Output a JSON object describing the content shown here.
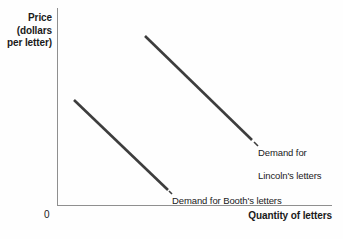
{
  "chart_data": {
    "type": "line",
    "title": "",
    "xlabel": "Quantity of letters",
    "ylabel": "Price\n(dollars\nper letter)",
    "ylabel_lines": [
      "Price",
      "(dollars",
      "per letter)"
    ],
    "origin_label": "0",
    "grid": false,
    "axes_shown": [
      "x",
      "y"
    ],
    "tick_labels": {
      "x": [],
      "y": []
    },
    "legend_position": "inline-annotation",
    "series": [
      {
        "name": "Demand for Lincoln's letters",
        "label_lines": [
          "Demand for",
          "Lincoln's letters"
        ],
        "color": "#3d3d3d",
        "x": [
          0.32,
          0.71
        ],
        "y": [
          0.86,
          0.33
        ],
        "description": "Higher demand curve, positioned up and to the right"
      },
      {
        "name": "Demand for Booth's letters",
        "label_lines": [
          "Demand for Booth's letters"
        ],
        "color": "#3d3d3d",
        "x": [
          0.06,
          0.4
        ],
        "y": [
          0.53,
          0.08
        ],
        "description": "Lower demand curve, positioned down and to the left"
      }
    ],
    "annotations": [
      {
        "text": "Demand for Lincoln's letters",
        "anchor": "right-of-upper-curve"
      },
      {
        "text": "Demand for Booth's letters",
        "anchor": "right-of-lower-curve"
      }
    ],
    "colors": {
      "axis": "#8f8f8f",
      "curve": "#3d3d3d",
      "text": "#1a1a1a",
      "background": "#fefefe"
    }
  },
  "geometry": {
    "lincoln_curve": {
      "x1": 145,
      "y1": 36,
      "x2": 252,
      "y2": 140
    },
    "booth_curve": {
      "x1": 74,
      "y1": 100,
      "x2": 168,
      "y2": 190
    },
    "lincoln_leader": {
      "x1": 254,
      "y1": 142,
      "x2": 258,
      "y2": 146
    },
    "booth_leader": {
      "x1": 169,
      "y1": 191,
      "x2": 172,
      "y2": 194
    }
  }
}
